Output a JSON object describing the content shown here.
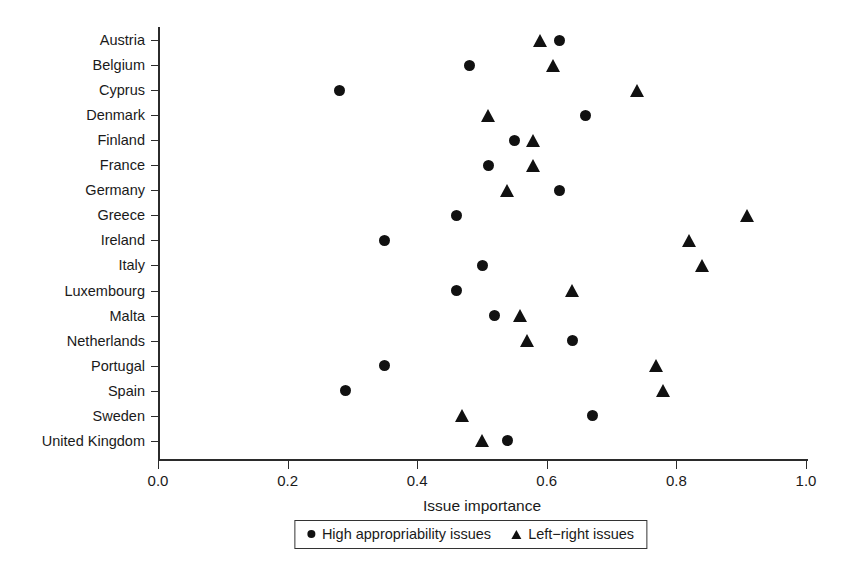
{
  "chart_data": {
    "type": "scatter",
    "title": "",
    "xlabel": "Issue importance",
    "ylabel": "",
    "xlim": [
      0.0,
      1.0
    ],
    "xticks": [
      "0.0",
      "0.2",
      "0.4",
      "0.6",
      "0.8",
      "1.0"
    ],
    "xtick_values": [
      0.0,
      0.2,
      0.4,
      0.6,
      0.8,
      1.0
    ],
    "grid": false,
    "legend_position": "bottom-center",
    "categories": [
      "Austria",
      "Belgium",
      "Cyprus",
      "Denmark",
      "Finland",
      "France",
      "Germany",
      "Greece",
      "Ireland",
      "Italy",
      "Luxembourg",
      "Malta",
      "Netherlands",
      "Portugal",
      "Spain",
      "Sweden",
      "United Kingdom"
    ],
    "series": [
      {
        "name": "High appropriability issues",
        "marker": "circle",
        "color": "#111111",
        "values": [
          0.62,
          0.48,
          0.28,
          0.66,
          0.55,
          0.51,
          0.62,
          0.46,
          0.35,
          0.5,
          0.46,
          0.52,
          0.64,
          0.35,
          0.29,
          0.67,
          0.54
        ]
      },
      {
        "name": "Left-right issues",
        "marker": "triangle",
        "color": "#111111",
        "values": [
          0.59,
          0.61,
          0.74,
          0.51,
          0.58,
          0.58,
          0.54,
          0.91,
          0.82,
          0.84,
          0.64,
          0.56,
          0.57,
          0.77,
          0.78,
          0.47,
          0.5
        ]
      }
    ]
  },
  "legend": {
    "entries": [
      {
        "label": "High appropriability issues",
        "glyph": "circle-marker-icon"
      },
      {
        "label": "Left−right issues",
        "glyph": "triangle-marker-icon"
      }
    ]
  }
}
